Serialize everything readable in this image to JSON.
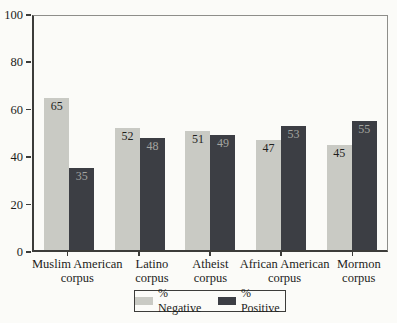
{
  "chart_data": {
    "type": "bar",
    "categories": [
      "Muslim American\ncorpus",
      "Latino\ncorpus",
      "Atheist\ncorpus",
      "African American\ncorpus",
      "Mormon\ncorpus"
    ],
    "series": [
      {
        "name": "% Negative",
        "values": [
          65,
          52,
          51,
          47,
          45
        ],
        "color": "#c9cac4",
        "value_label_color": "#1f1f1d"
      },
      {
        "name": "% Positive",
        "values": [
          35,
          48,
          49,
          53,
          55
        ],
        "color": "#3c3e44",
        "value_label_color": "#a4a5a0"
      }
    ],
    "title": "",
    "xlabel": "",
    "ylabel": "",
    "ylim": [
      0,
      100
    ],
    "yticks": [
      0,
      20,
      40,
      60,
      80,
      100
    ],
    "grid": false,
    "legend_position": "bottom",
    "show_value_labels": true
  },
  "colors": {
    "background": "#fbfbf8",
    "axis_dark": "#3c3c3a",
    "axis_light": "#8e8e8a",
    "text": "#1d1d1b"
  }
}
